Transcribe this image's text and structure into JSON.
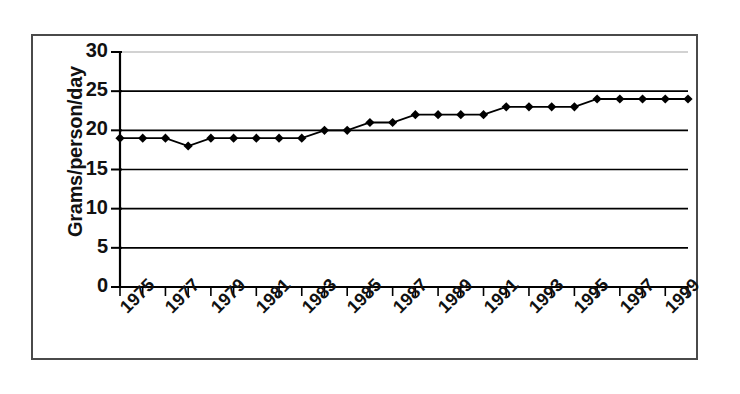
{
  "chart_data": {
    "type": "line",
    "title": "",
    "xlabel": "",
    "ylabel": "Grams/person/day",
    "ylim": [
      0,
      30
    ],
    "ytick_values": [
      0,
      5,
      10,
      15,
      20,
      25,
      30
    ],
    "ytick_labels": [
      "0",
      "5",
      "10",
      "15",
      "20",
      "25",
      "30"
    ],
    "xlim": [
      1975,
      2000
    ],
    "xtick_values": [
      1975,
      1977,
      1979,
      1981,
      1983,
      1985,
      1987,
      1989,
      1991,
      1993,
      1995,
      1997,
      1999
    ],
    "xtick_labels": [
      "1975",
      "1977",
      "1979",
      "1981",
      "1983",
      "1985",
      "1987",
      "1989",
      "1991",
      "1993",
      "1995",
      "1997",
      "1999"
    ],
    "grid": "horizontal",
    "legend": "none",
    "marker": "diamond",
    "line_color": "#000000",
    "marker_color": "#000000",
    "grid_color": "#000000",
    "background_color": "#ffffff",
    "x": [
      1975,
      1976,
      1977,
      1978,
      1979,
      1980,
      1981,
      1982,
      1983,
      1984,
      1985,
      1986,
      1987,
      1988,
      1989,
      1990,
      1991,
      1992,
      1993,
      1994,
      1995,
      1996,
      1997,
      1998,
      1999,
      2000
    ],
    "values": [
      19,
      19,
      19,
      18,
      19,
      19,
      19,
      19,
      19,
      20,
      20,
      21,
      21,
      22,
      22,
      22,
      22,
      23,
      23,
      23,
      23,
      24,
      24,
      24,
      24,
      24
    ],
    "series": [
      {
        "name": "Grams/person/day",
        "values": [
          19,
          19,
          19,
          18,
          19,
          19,
          19,
          19,
          19,
          20,
          20,
          21,
          21,
          22,
          22,
          22,
          22,
          23,
          23,
          23,
          23,
          24,
          24,
          24,
          24,
          24
        ]
      }
    ]
  }
}
